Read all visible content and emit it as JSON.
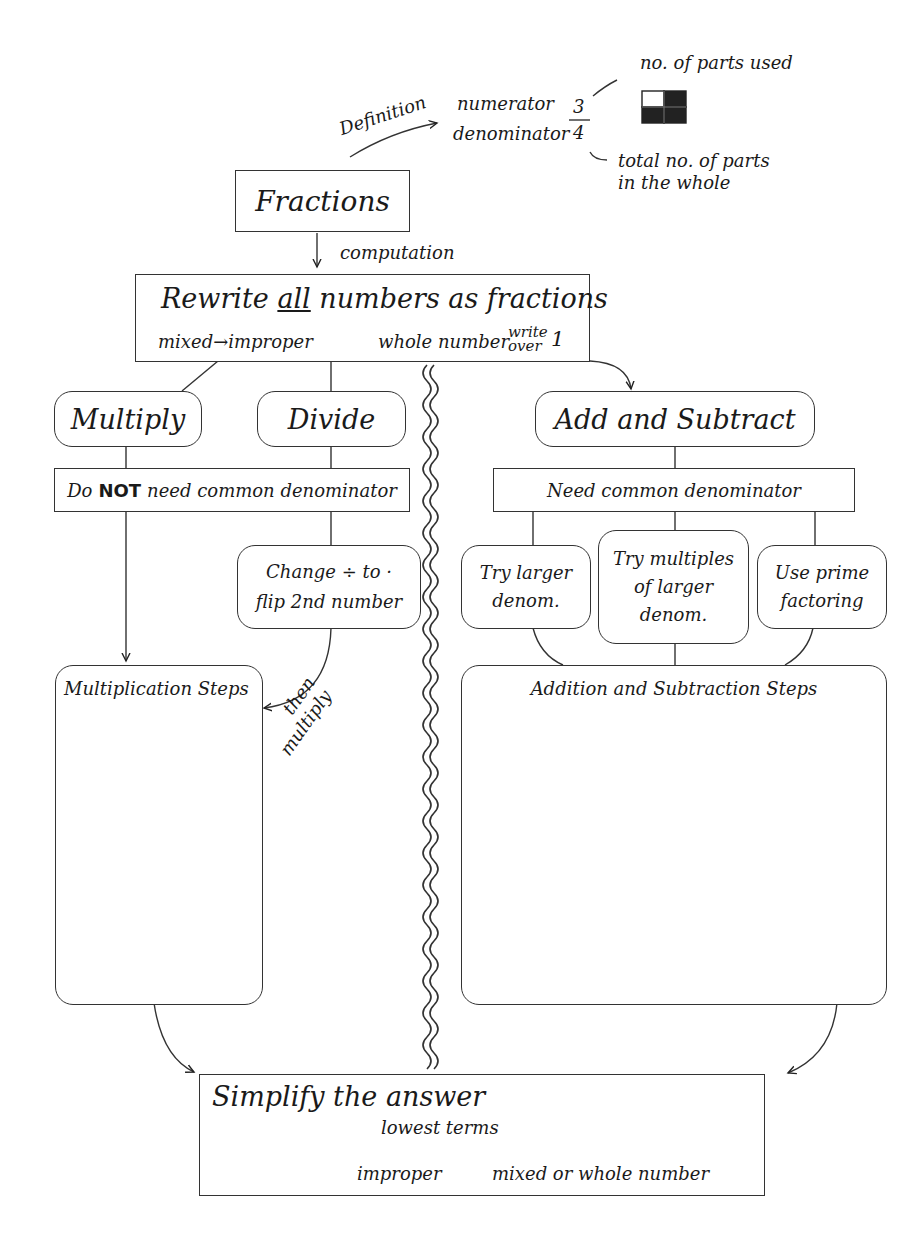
{
  "diagram": {
    "root": {
      "label": "Fractions"
    },
    "definition": {
      "arrow_label": "Definition",
      "numerator_label": "numerator",
      "denominator_label": "denominator",
      "numerator_value": "3",
      "denominator_value": "4",
      "parts_used_label": "no. of parts used",
      "total_parts_label_line1": "total no. of parts",
      "total_parts_label_line2": "in the whole",
      "grid": {
        "cells": 4,
        "shaded": 3
      }
    },
    "computation_label": "computation",
    "rewrite": {
      "title_pre": "Rewrite ",
      "title_emph": "all",
      "title_post": " numbers as fractions",
      "mixed_note": "mixed→improper",
      "whole_note": "whole number",
      "write_note": "write",
      "over_note": "over",
      "one_note": "1"
    },
    "multiply": {
      "label": "Multiply"
    },
    "divide": {
      "label": "Divide"
    },
    "no_common": {
      "pre": "Do ",
      "emph": "NOT",
      "post": " need common denominator"
    },
    "change": {
      "line1": "Change ÷ to ·",
      "line2": "flip 2nd number"
    },
    "then_multiply": {
      "line1": "then",
      "line2": "multiply"
    },
    "mult_steps": {
      "label": "Multiplication Steps"
    },
    "add_sub": {
      "label": "Add and Subtract"
    },
    "need_common": {
      "label": "Need common denominator"
    },
    "options": [
      {
        "line1": "Try larger",
        "line2": "denom.",
        "line3": ""
      },
      {
        "line1": "Try multiples",
        "line2": "of larger",
        "line3": "denom."
      },
      {
        "line1": "Use prime",
        "line2": "factoring",
        "line3": ""
      }
    ],
    "add_steps": {
      "label": "Addition and Subtraction Steps"
    },
    "simplify": {
      "title": "Simplify the answer",
      "branch1": "lowest terms",
      "branch2_from": "improper",
      "branch2_to": "mixed or whole number"
    }
  }
}
